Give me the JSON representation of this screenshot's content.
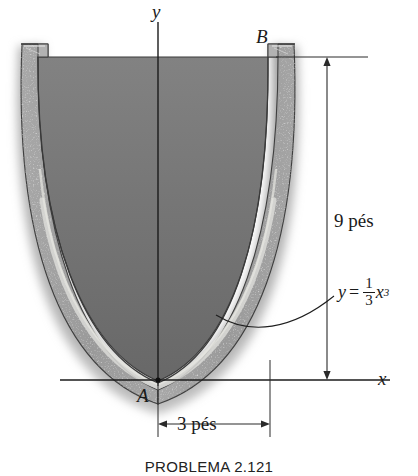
{
  "figure": {
    "caption": "PROBLEMA 2.121",
    "axes": {
      "y_label": "y",
      "x_label": "x"
    },
    "points": [
      {
        "name": "A",
        "label": "A",
        "desc": "bottom vertex of curve at origin"
      },
      {
        "name": "B",
        "label": "B",
        "desc": "top right rim of vessel"
      }
    ],
    "dimensions": [
      {
        "name": "height",
        "label": "9 pés",
        "value": 9,
        "unit": "pés",
        "orientation": "vertical"
      },
      {
        "name": "half-width",
        "label": "3 pés",
        "value": 3,
        "unit": "pés",
        "orientation": "horizontal"
      }
    ],
    "equation": {
      "lhs": "y",
      "equals": "=",
      "numerator": "1",
      "denominator": "3",
      "variable": "x",
      "exponent": "3",
      "plain": "y = (1/3)x^3"
    },
    "colors": {
      "inner_fill_top": "#7c7c7c",
      "inner_fill_bottom": "#6a6a6a",
      "wall_fill": "#a0a0a0",
      "outline": "#3a3a3a",
      "highlight": "#d8d8d4",
      "background": "#ffffff",
      "text": "#1a1a1a"
    },
    "curve": {
      "type": "cubic",
      "expression": "y = x^3/3",
      "x_range": [
        -3,
        3
      ],
      "y_range": [
        0,
        9
      ]
    }
  }
}
